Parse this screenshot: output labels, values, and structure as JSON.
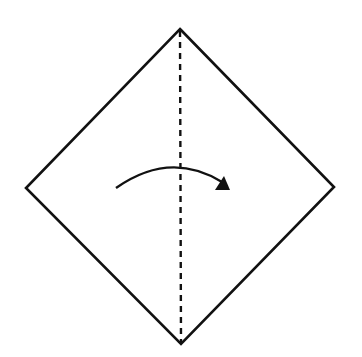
{
  "diagram": {
    "type": "origami-fold-step",
    "description": "Square paper rotated as a diamond with a vertical valley-fold line and an arrow indicating folding left half over to the right",
    "colors": {
      "stroke": "#111111",
      "background": "#ffffff"
    },
    "paper": {
      "shape": "diamond",
      "vertices": {
        "top": [
          180,
          29
        ],
        "right": [
          334,
          187
        ],
        "bottom": [
          181,
          344
        ],
        "left": [
          26,
          188
        ]
      }
    },
    "fold_line": {
      "style": "dashed",
      "kind": "valley-fold",
      "from": [
        180,
        29
      ],
      "to": [
        181,
        344
      ]
    },
    "arrow": {
      "direction": "left-to-right",
      "start": [
        116,
        188
      ],
      "control": [
        178,
        145
      ],
      "end": [
        227,
        187
      ],
      "label": "fold"
    }
  }
}
